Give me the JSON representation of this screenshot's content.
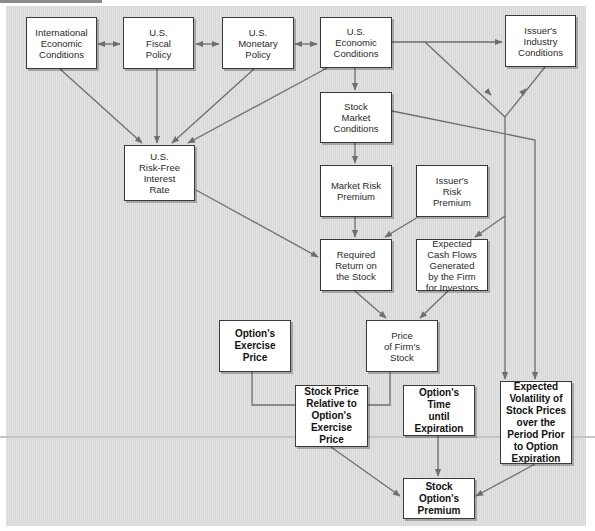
{
  "diagram": {
    "colors": {
      "background": "#dcdcdc",
      "box_fill": "#ffffff",
      "box_border": "#3a3a3a",
      "arrow": "#6e6e6e"
    },
    "nodes": {
      "international_economic_conditions": "International\nEconomic\nConditions",
      "us_fiscal_policy": "U.S.\nFiscal\nPolicy",
      "us_monetary_policy": "U.S.\nMonetary\nPolicy",
      "us_economic_conditions": "U.S.\nEconomic\nConditions",
      "issuers_industry_conditions": "Issuer's\nIndustry\nConditions",
      "stock_market_conditions": "Stock\nMarket\nConditions",
      "us_risk_free_interest_rate": "U.S.\nRisk-Free\nInterest\nRate",
      "market_risk_premium": "Market Risk\nPremium",
      "issuers_risk_premium": "Issuer's\nRisk\nPremium",
      "required_return_on_stock": "Required\nReturn on\nthe Stock",
      "expected_cash_flows": "Expected\nCash Flows\nGenerated\nby the Firm\nfor Investors",
      "options_exercise_price": "Option's\nExercise\nPrice",
      "price_of_firms_stock": "Price\nof Firm's\nStock",
      "stock_price_relative_to_exercise_price": "Stock Price\nRelative to\nOption's\nExercise\nPrice",
      "options_time_until_expiration": "Option's\nTime\nuntil\nExpiration",
      "expected_volatility": "Expected\nVolatility of\nStock Prices\nover the\nPeriod Prior\nto Option\nExpiration",
      "stock_options_premium": "Stock Option's\nPremium"
    },
    "edges": [
      {
        "from": "international_economic_conditions",
        "to": "us_fiscal_policy",
        "type": "bidirectional"
      },
      {
        "from": "us_fiscal_policy",
        "to": "us_monetary_policy",
        "type": "bidirectional"
      },
      {
        "from": "us_monetary_policy",
        "to": "us_economic_conditions",
        "type": "bidirectional"
      },
      {
        "from": "us_economic_conditions",
        "to": "issuers_industry_conditions",
        "type": "arrow"
      },
      {
        "from": "international_economic_conditions",
        "to": "us_risk_free_interest_rate",
        "type": "arrow"
      },
      {
        "from": "us_fiscal_policy",
        "to": "us_risk_free_interest_rate",
        "type": "arrow"
      },
      {
        "from": "us_monetary_policy",
        "to": "us_risk_free_interest_rate",
        "type": "arrow"
      },
      {
        "from": "us_economic_conditions",
        "to": "us_risk_free_interest_rate",
        "type": "arrow"
      },
      {
        "from": "us_economic_conditions",
        "to": "stock_market_conditions",
        "type": "arrow"
      },
      {
        "from": "us_economic_conditions",
        "to": "expected_volatility",
        "type": "arrow"
      },
      {
        "from": "issuers_industry_conditions",
        "to": "expected_volatility",
        "type": "arrow"
      },
      {
        "from": "stock_market_conditions",
        "to": "market_risk_premium",
        "type": "arrow"
      },
      {
        "from": "stock_market_conditions",
        "to": "expected_volatility",
        "type": "arrow"
      },
      {
        "from": "us_risk_free_interest_rate",
        "to": "required_return_on_stock",
        "type": "arrow"
      },
      {
        "from": "market_risk_premium",
        "to": "required_return_on_stock",
        "type": "arrow"
      },
      {
        "from": "issuers_risk_premium",
        "to": "required_return_on_stock",
        "type": "arrow"
      },
      {
        "from": "issuers_industry_conditions",
        "to": "expected_cash_flows",
        "type": "arrow"
      },
      {
        "from": "required_return_on_stock",
        "to": "price_of_firms_stock",
        "type": "arrow"
      },
      {
        "from": "expected_cash_flows",
        "to": "price_of_firms_stock",
        "type": "arrow"
      },
      {
        "from": "options_exercise_price",
        "to": "stock_price_relative_to_exercise_price",
        "type": "line"
      },
      {
        "from": "price_of_firms_stock",
        "to": "stock_price_relative_to_exercise_price",
        "type": "line"
      },
      {
        "from": "stock_price_relative_to_exercise_price",
        "to": "stock_options_premium",
        "type": "arrow"
      },
      {
        "from": "options_time_until_expiration",
        "to": "stock_options_premium",
        "type": "arrow"
      },
      {
        "from": "expected_volatility",
        "to": "stock_options_premium",
        "type": "arrow"
      }
    ]
  }
}
